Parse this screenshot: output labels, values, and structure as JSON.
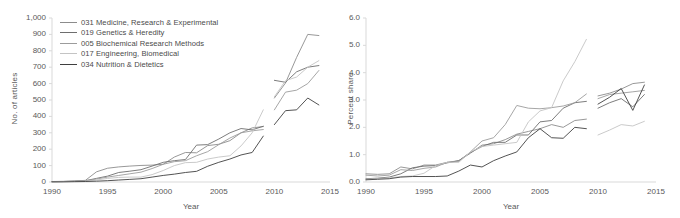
{
  "figure": {
    "panels": [
      {
        "name": "articles-panel",
        "title": "",
        "ylabel": "No. of articles",
        "xlabel": "Year",
        "yticks": [
          "0",
          "100",
          "200",
          "300",
          "400",
          "500",
          "600",
          "700",
          "800",
          "900",
          "1,000"
        ],
        "xticks": [
          "1990",
          "1995",
          "2000",
          "2005",
          "2010",
          "2015"
        ],
        "has_legend": true
      },
      {
        "name": "share-panel",
        "title": "",
        "ylabel": "Percent share",
        "xlabel": "Year",
        "yticks": [
          "0.0",
          "1.0",
          "2.0",
          "3.0",
          "4.0",
          "5.0",
          "6.0"
        ],
        "xticks": [
          "1990",
          "1995",
          "2000",
          "2005",
          "2010",
          "2015"
        ],
        "has_legend": false
      }
    ]
  },
  "legend": {
    "entries": [
      {
        "label": "031 Medicine, Research & Experimental",
        "color": "#8c8c8c"
      },
      {
        "label": "019 Genetics & Heredity",
        "color": "#6e6e6e"
      },
      {
        "label": "005 Biochemical Research Methods",
        "color": "#9c9c9c"
      },
      {
        "label": "017 Engineering, Biomedical",
        "color": "#c4c4c4"
      },
      {
        "label": "034 Nutrition & Dietetics",
        "color": "#3f3f3f"
      }
    ]
  },
  "chart_data": [
    {
      "type": "line",
      "title": "No. of articles by subject category",
      "xlabel": "Year",
      "ylabel": "No. of articles",
      "xlim": [
        1990,
        2015
      ],
      "ylim": [
        0,
        1000
      ],
      "ytick_step": 100,
      "xtick_step": 5,
      "grid": false,
      "legend_position": "top-left",
      "note": "Series are split into two segments with a data gap between 2009 and 2010.",
      "series": [
        {
          "name": "031 Medicine, Research & Experimental",
          "color": "#8c8c8c",
          "segments": [
            {
              "x": [
                1990,
                1991,
                1992,
                1993,
                1994,
                1995,
                1996,
                1997,
                1998,
                1999,
                2000,
                2001,
                2002,
                2003,
                2004,
                2005,
                2006,
                2007,
                2008,
                2009
              ],
              "y": [
                3,
                4,
                6,
                10,
                62,
                84,
                92,
                97,
                101,
                103,
                108,
                152,
                180,
                178,
                222,
                230,
                252,
                300,
                330,
                338
              ]
            },
            {
              "x": [
                2010,
                2011,
                2012,
                2013,
                2014
              ],
              "y": [
                512,
                604,
                760,
                900,
                893
              ]
            }
          ]
        },
        {
          "name": "019 Genetics & Heredity",
          "color": "#6e6e6e",
          "segments": [
            {
              "x": [
                1990,
                1991,
                1992,
                1993,
                1994,
                1995,
                1996,
                1997,
                1998,
                1999,
                2000,
                2001,
                2002,
                2003,
                2004,
                2005,
                2006,
                2007,
                2008,
                2009
              ],
              "y": [
                2,
                3,
                5,
                8,
                22,
                36,
                58,
                66,
                75,
                97,
                120,
                130,
                137,
                225,
                228,
                262,
                300,
                326,
                318,
                340
              ]
            },
            {
              "x": [
                2010,
                2011,
                2012,
                2013,
                2014
              ],
              "y": [
                620,
                608,
                672,
                700,
                710
              ]
            }
          ]
        },
        {
          "name": "005 Biochemical Research Methods",
          "color": "#9c9c9c",
          "segments": [
            {
              "x": [
                1990,
                1991,
                1992,
                1993,
                1994,
                1995,
                1996,
                1997,
                1998,
                1999,
                2000,
                2001,
                2002,
                2003,
                2004,
                2005,
                2006,
                2007,
                2008,
                2009
              ],
              "y": [
                2,
                3,
                4,
                7,
                18,
                30,
                40,
                50,
                60,
                82,
                108,
                124,
                130,
                160,
                185,
                228,
                268,
                300,
                312,
                320
              ]
            },
            {
              "x": [
                2010,
                2011,
                2012,
                2013,
                2014
              ],
              "y": [
                440,
                548,
                560,
                600,
                680
              ]
            }
          ]
        },
        {
          "name": "017 Engineering, Biomedical",
          "color": "#c4c4c4",
          "segments": [
            {
              "x": [
                1990,
                1991,
                1992,
                1993,
                1994,
                1995,
                1996,
                1997,
                1998,
                1999,
                2000,
                2001,
                2002,
                2003,
                2004,
                2005,
                2006,
                2007,
                2008,
                2009
              ],
              "y": [
                1,
                2,
                3,
                5,
                12,
                22,
                28,
                30,
                30,
                45,
                70,
                100,
                118,
                120,
                140,
                152,
                160,
                220,
                300,
                440
              ]
            },
            {
              "x": [
                2010,
                2011,
                2012,
                2013,
                2014
              ],
              "y": [
                520,
                618,
                640,
                700,
                740
              ]
            }
          ]
        },
        {
          "name": "034 Nutrition & Dietetics",
          "color": "#3f3f3f",
          "segments": [
            {
              "x": [
                1990,
                1991,
                1992,
                1993,
                1994,
                1995,
                1996,
                1997,
                1998,
                1999,
                2000,
                2001,
                2002,
                2003,
                2004,
                2005,
                2006,
                2007,
                2008,
                2009
              ],
              "y": [
                1,
                1,
                2,
                3,
                5,
                8,
                12,
                16,
                20,
                30,
                40,
                48,
                58,
                65,
                96,
                120,
                140,
                165,
                180,
                280
              ]
            },
            {
              "x": [
                2010,
                2011,
                2012,
                2013,
                2014
              ],
              "y": [
                350,
                435,
                440,
                512,
                470
              ]
            }
          ]
        }
      ]
    },
    {
      "type": "line",
      "title": "Percent share by subject category",
      "xlabel": "Year",
      "ylabel": "Percent share",
      "xlim": [
        1990,
        2015
      ],
      "ylim": [
        0,
        6
      ],
      "ytick_step": 1,
      "xtick_step": 5,
      "grid": false,
      "legend_position": "none",
      "note": "Series are split into two segments with a data gap between 2009 and 2010.",
      "series": [
        {
          "name": "031 Medicine, Research & Experimental",
          "color": "#8c8c8c",
          "segments": [
            {
              "x": [
                1990,
                1991,
                1992,
                1993,
                1994,
                1995,
                1996,
                1997,
                1998,
                1999,
                2000,
                2001,
                2002,
                2003,
                2004,
                2005,
                2006,
                2007,
                2008,
                2009
              ],
              "y": [
                0.3,
                0.28,
                0.3,
                0.55,
                0.48,
                0.62,
                0.62,
                0.72,
                0.78,
                1.05,
                1.35,
                1.4,
                1.55,
                1.75,
                1.85,
                1.95,
                2.1,
                2.0,
                2.25,
                2.3
              ]
            },
            {
              "x": [
                2010,
                2011,
                2012,
                2013,
                2014
              ],
              "y": [
                3.15,
                3.25,
                3.4,
                3.6,
                3.65
              ]
            }
          ]
        },
        {
          "name": "019 Genetics & Heredity",
          "color": "#6e6e6e",
          "segments": [
            {
              "x": [
                1990,
                1991,
                1992,
                1993,
                1994,
                1995,
                1996,
                1997,
                1998,
                1999,
                2000,
                2001,
                2002,
                2003,
                2004,
                2005,
                2006,
                2007,
                2008,
                2009
              ],
              "y": [
                0.12,
                0.14,
                0.18,
                0.3,
                0.52,
                0.58,
                0.6,
                0.7,
                0.78,
                1.08,
                1.3,
                1.45,
                1.45,
                1.72,
                1.72,
                2.2,
                2.25,
                2.7,
                2.9,
                2.95
              ]
            },
            {
              "x": [
                2010,
                2011,
                2012,
                2013,
                2014
              ],
              "y": [
                2.7,
                2.9,
                3.05,
                2.75,
                3.2
              ]
            }
          ]
        },
        {
          "name": "005 Biochemical Research Methods",
          "color": "#9c9c9c",
          "segments": [
            {
              "x": [
                1990,
                1991,
                1992,
                1993,
                1994,
                1995,
                1996,
                1997,
                1998,
                1999,
                2000,
                2001,
                2002,
                2003,
                2004,
                2005,
                2006,
                2007,
                2008,
                2009
              ],
              "y": [
                0.25,
                0.22,
                0.25,
                0.45,
                0.42,
                0.5,
                0.55,
                0.72,
                0.75,
                1.1,
                1.5,
                1.62,
                2.1,
                2.8,
                2.7,
                2.68,
                2.72,
                2.78,
                2.9,
                3.22
              ]
            },
            {
              "x": [
                2010,
                2011,
                2012,
                2013,
                2014
              ],
              "y": [
                3.05,
                3.2,
                3.25,
                3.3,
                3.35
              ]
            }
          ]
        },
        {
          "name": "017 Engineering, Biomedical",
          "color": "#c4c4c4",
          "segments": [
            {
              "x": [
                1990,
                1991,
                1992,
                1993,
                1994,
                1995,
                1996,
                1997,
                1998,
                1999,
                2000,
                2001,
                2002,
                2003,
                2004,
                2005,
                2006,
                2007,
                2008,
                2009
              ],
              "y": [
                0.1,
                0.12,
                0.15,
                0.2,
                0.22,
                0.32,
                0.6,
                0.72,
                0.72,
                1.1,
                1.3,
                1.35,
                1.4,
                1.45,
                2.2,
                2.6,
                2.72,
                3.7,
                4.4,
                5.22
              ]
            },
            {
              "x": [
                2010,
                2011,
                2012,
                2013,
                2014
              ],
              "y": [
                1.72,
                1.9,
                2.1,
                2.05,
                2.22
              ]
            }
          ]
        },
        {
          "name": "034 Nutrition & Dietetics",
          "color": "#3f3f3f",
          "segments": [
            {
              "x": [
                1990,
                1991,
                1992,
                1993,
                1994,
                1995,
                1996,
                1997,
                1998,
                1999,
                2000,
                2001,
                2002,
                2003,
                2004,
                2005,
                2006,
                2007,
                2008,
                2009
              ],
              "y": [
                0.08,
                0.1,
                0.12,
                0.18,
                0.2,
                0.2,
                0.2,
                0.22,
                0.4,
                0.62,
                0.55,
                0.78,
                0.95,
                1.1,
                1.62,
                1.95,
                1.62,
                1.6,
                2.0,
                1.95
              ]
            },
            {
              "x": [
                2010,
                2011,
                2012,
                2013,
                2014
              ],
              "y": [
                2.85,
                3.1,
                3.42,
                2.62,
                3.55
              ]
            }
          ]
        }
      ]
    }
  ]
}
